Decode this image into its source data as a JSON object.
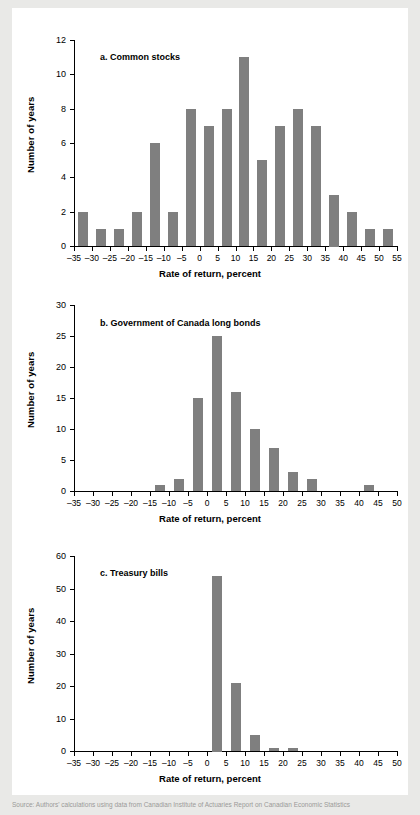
{
  "figure": {
    "background_color": "#e9e9e7",
    "panel_color": "#ffffff",
    "bar_color": "#7f7f7f",
    "axis_color": "#000000",
    "source_note": "Source: Authors' calculations using data from Canadian Institute of Actuaries Report on Canadian Economic Statistics"
  },
  "chart_data": [
    {
      "type": "bar",
      "id": "a",
      "title": "a. Common stocks",
      "xlabel": "Rate of return, percent",
      "ylabel": "Number of years",
      "xlim": [
        -35,
        55
      ],
      "ylim": [
        0,
        12
      ],
      "xticks": [
        -35,
        -30,
        -25,
        -20,
        -15,
        -10,
        -5,
        0,
        5,
        10,
        15,
        20,
        25,
        30,
        35,
        40,
        45,
        50,
        55
      ],
      "xtick_labels": [
        "–35",
        "–30",
        "–25",
        "–20",
        "–15",
        "–10",
        "–5",
        "0",
        "5",
        "10",
        "15",
        "20",
        "25",
        "30",
        "35",
        "40",
        "45",
        "50",
        "55"
      ],
      "yticks": [
        0,
        2,
        4,
        6,
        8,
        10,
        12
      ],
      "ytick_labels": [
        "0",
        "2",
        "4",
        "6",
        "8",
        "10",
        "12"
      ],
      "bin_width": 5,
      "grid": false,
      "legend": null,
      "categories": [
        "-35 to -30",
        "-30 to -25",
        "-25 to -20",
        "-20 to -15",
        "-15 to -10",
        "-10 to -5",
        "-5 to 0",
        "0 to 5",
        "5 to 10",
        "10 to 15",
        "15 to 20",
        "20 to 25",
        "25 to 30",
        "30 to 35",
        "35 to 40",
        "40 to 45",
        "45 to 50",
        "50 to 55"
      ],
      "bin_starts": [
        -35,
        -30,
        -25,
        -20,
        -15,
        -10,
        -5,
        0,
        5,
        10,
        15,
        20,
        25,
        30,
        35,
        40,
        45,
        50
      ],
      "values": [
        2,
        1,
        1,
        2,
        6,
        2,
        8,
        7,
        8,
        11,
        5,
        7,
        8,
        7,
        3,
        2,
        1,
        1
      ]
    },
    {
      "type": "bar",
      "id": "b",
      "title": "b. Government of Canada long bonds",
      "xlabel": "Rate of return, percent",
      "ylabel": "Number of years",
      "xlim": [
        -35,
        50
      ],
      "ylim": [
        0,
        30
      ],
      "xticks": [
        -35,
        -30,
        -25,
        -20,
        -15,
        -10,
        -5,
        0,
        5,
        10,
        15,
        20,
        25,
        30,
        35,
        40,
        45,
        50
      ],
      "xtick_labels": [
        "–35",
        "–30",
        "–25",
        "–20",
        "–15",
        "–10",
        "–5",
        "0",
        "5",
        "10",
        "15",
        "20",
        "25",
        "30",
        "35",
        "40",
        "45",
        "50"
      ],
      "yticks": [
        0,
        5,
        10,
        15,
        20,
        25,
        30
      ],
      "ytick_labels": [
        "0",
        "5",
        "10",
        "15",
        "20",
        "25",
        "30"
      ],
      "bin_width": 5,
      "grid": false,
      "legend": null,
      "categories": [
        "-35 to -30",
        "-30 to -25",
        "-25 to -20",
        "-20 to -15",
        "-15 to -10",
        "-10 to -5",
        "-5 to 0",
        "0 to 5",
        "5 to 10",
        "10 to 15",
        "15 to 20",
        "20 to 25",
        "25 to 30",
        "30 to 35",
        "35 to 40",
        "40 to 45",
        "45 to 50"
      ],
      "bin_starts": [
        -35,
        -30,
        -25,
        -20,
        -15,
        -10,
        -5,
        0,
        5,
        10,
        15,
        20,
        25,
        30,
        35,
        40,
        45
      ],
      "values": [
        0,
        0,
        0,
        0,
        1,
        2,
        15,
        25,
        16,
        10,
        7,
        3,
        2,
        0,
        0,
        1,
        0
      ]
    },
    {
      "type": "bar",
      "id": "c",
      "title": "c. Treasury bills",
      "xlabel": "Rate of return, percent",
      "ylabel": "Number of years",
      "xlim": [
        -35,
        50
      ],
      "ylim": [
        0,
        60
      ],
      "xticks": [
        -35,
        -30,
        -25,
        -20,
        -15,
        -10,
        -5,
        0,
        5,
        10,
        15,
        20,
        25,
        30,
        35,
        40,
        45,
        50
      ],
      "xtick_labels": [
        "–35",
        "–30",
        "–25",
        "–20",
        "–15",
        "–10",
        "–5",
        "0",
        "5",
        "10",
        "15",
        "20",
        "25",
        "30",
        "35",
        "40",
        "45",
        "50"
      ],
      "yticks": [
        0,
        10,
        20,
        30,
        40,
        50,
        60
      ],
      "ytick_labels": [
        "0",
        "10",
        "20",
        "30",
        "40",
        "50",
        "60"
      ],
      "bin_width": 5,
      "grid": false,
      "legend": null,
      "categories": [
        "-35 to -30",
        "-30 to -25",
        "-25 to -20",
        "-20 to -15",
        "-15 to -10",
        "-10 to -5",
        "-5 to 0",
        "0 to 5",
        "5 to 10",
        "10 to 15",
        "15 to 20",
        "20 to 25",
        "25 to 30",
        "30 to 35",
        "35 to 40",
        "40 to 45",
        "45 to 50"
      ],
      "bin_starts": [
        -35,
        -30,
        -25,
        -20,
        -15,
        -10,
        -5,
        0,
        5,
        10,
        15,
        20,
        25,
        30,
        35,
        40,
        45
      ],
      "values": [
        0,
        0,
        0,
        0,
        0,
        0,
        0,
        54,
        21,
        5,
        1,
        1,
        0,
        0,
        0,
        0,
        0
      ]
    }
  ]
}
